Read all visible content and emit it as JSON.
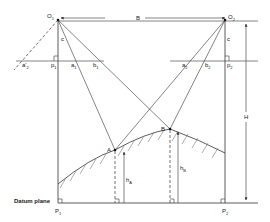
{
  "diagram": {
    "labels": {
      "o1": "O",
      "o1_sub": "1",
      "o2": "O",
      "o2_sub": "2",
      "base": "B",
      "focal_left": "c",
      "focal_right": "c",
      "height": "H",
      "point_a": "A",
      "point_b": "B",
      "ha": "h",
      "ha_sub": "A",
      "hb": "h",
      "hb_sub": "B",
      "a2_left": "a'",
      "a2_left_sub": "2",
      "p1_top": "p",
      "p1_top_sub": "1",
      "a1": "a",
      "a1_sub": "1",
      "b1": "b",
      "b1_sub": "1",
      "a2": "a",
      "a2_sub": "2",
      "b2": "b",
      "b2_sub": "2",
      "p2_top": "p",
      "p2_top_sub": "2",
      "datum": "Datum plane",
      "p1_bottom": "P",
      "p1_bottom_sub": "1",
      "p2_bottom": "P",
      "p2_bottom_sub": "2"
    }
  }
}
